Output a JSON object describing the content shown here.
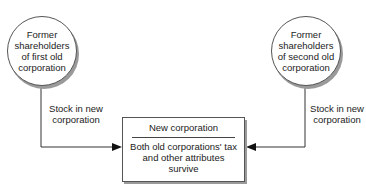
{
  "diagram": {
    "left_entity": {
      "label": "Former shareholders of first old corporation"
    },
    "right_entity": {
      "label": "Former shareholders of second old corporation"
    },
    "left_edge": {
      "label": "Stock in new corporation"
    },
    "right_edge": {
      "label": "Stock in new corporation"
    },
    "center_entity": {
      "title": "New corporation",
      "body": "Both old corporations' tax and other attributes survive"
    },
    "colors": {
      "line": "#333333",
      "shadow": "#9a9a9a",
      "fill": "#ffffff"
    }
  }
}
